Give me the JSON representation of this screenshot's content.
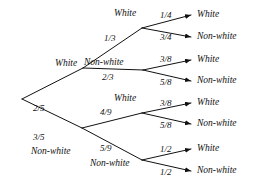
{
  "diagram": {
    "type": "probability-tree",
    "title": "",
    "colors": {
      "line": "#111111",
      "text": "#111111",
      "background": "#ffffff"
    },
    "root": {
      "label": ""
    },
    "level1": [
      {
        "id": "l1-white",
        "outcome": "White",
        "probability": "2/5"
      },
      {
        "id": "l1-nonwhite",
        "outcome": "Non-white",
        "probability": "3/5"
      }
    ],
    "level2": [
      {
        "id": "l2-ww",
        "parent": "l1-white",
        "outcome": "White",
        "probability": "1/3"
      },
      {
        "id": "l2-wn",
        "parent": "l1-white",
        "outcome": "Non-white",
        "probability": "2/3"
      },
      {
        "id": "l2-nw",
        "parent": "l1-nonwhite",
        "outcome": "White",
        "probability": "4/9"
      },
      {
        "id": "l2-nn",
        "parent": "l1-nonwhite",
        "outcome": "Non-white",
        "probability": "5/9"
      }
    ],
    "level3": [
      {
        "id": "l3-1",
        "parent": "l2-ww",
        "outcome": "White",
        "probability": "1/4"
      },
      {
        "id": "l3-2",
        "parent": "l2-ww",
        "outcome": "Non-white",
        "probability": "3/4"
      },
      {
        "id": "l3-3",
        "parent": "l2-wn",
        "outcome": "White",
        "probability": "3/8"
      },
      {
        "id": "l3-4",
        "parent": "l2-wn",
        "outcome": "Non-white",
        "probability": "5/8"
      },
      {
        "id": "l3-5",
        "parent": "l2-nw",
        "outcome": "White",
        "probability": "3/8"
      },
      {
        "id": "l3-6",
        "parent": "l2-nw",
        "outcome": "Non-white",
        "probability": "5/8"
      },
      {
        "id": "l3-7",
        "parent": "l2-nn",
        "outcome": "White",
        "probability": "1/2"
      },
      {
        "id": "l3-8",
        "parent": "l2-nn",
        "outcome": "Non-white",
        "probability": "1/2"
      }
    ]
  }
}
